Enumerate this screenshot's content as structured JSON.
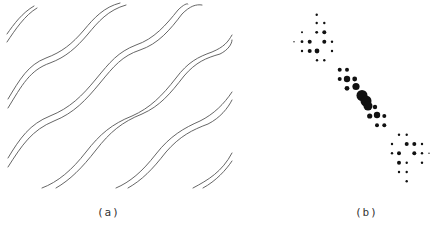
{
  "figure": {
    "panel_a": {
      "caption": "(a)",
      "description": "Pattern of diagonal wavy double lines",
      "stroke_color": "#555555"
    },
    "panel_b": {
      "caption": "(b)",
      "description": "Optical diffraction pattern of dots along a diagonal",
      "dot_color": "#111111",
      "dots": [
        {
          "x": 316.7,
          "y": 14.7,
          "r": 1.2
        },
        {
          "x": 316.7,
          "y": 23.0,
          "r": 1.2
        },
        {
          "x": 324.3,
          "y": 23.0,
          "r": 1.2
        },
        {
          "x": 302.0,
          "y": 32.3,
          "r": 1.0
        },
        {
          "x": 316.7,
          "y": 32.3,
          "r": 1.4
        },
        {
          "x": 324.3,
          "y": 32.3,
          "r": 2.0
        },
        {
          "x": 294.0,
          "y": 41.7,
          "r": 0.7
        },
        {
          "x": 302.0,
          "y": 41.7,
          "r": 1.4
        },
        {
          "x": 309.7,
          "y": 41.7,
          "r": 2.0
        },
        {
          "x": 324.3,
          "y": 41.7,
          "r": 2.0
        },
        {
          "x": 332.0,
          "y": 41.7,
          "r": 1.2
        },
        {
          "x": 302.0,
          "y": 51.0,
          "r": 1.2
        },
        {
          "x": 309.7,
          "y": 51.0,
          "r": 2.0
        },
        {
          "x": 317.0,
          "y": 51.0,
          "r": 2.4
        },
        {
          "x": 332.0,
          "y": 51.0,
          "r": 1.2
        },
        {
          "x": 317.0,
          "y": 60.3,
          "r": 1.2
        },
        {
          "x": 324.3,
          "y": 60.3,
          "r": 1.2
        },
        {
          "x": 339.7,
          "y": 69.7,
          "r": 2.0
        },
        {
          "x": 347.0,
          "y": 69.7,
          "r": 2.0
        },
        {
          "x": 339.7,
          "y": 79.0,
          "r": 2.0
        },
        {
          "x": 347.0,
          "y": 79.0,
          "r": 3.2
        },
        {
          "x": 354.7,
          "y": 79.0,
          "r": 2.4
        },
        {
          "x": 347.0,
          "y": 88.3,
          "r": 2.4
        },
        {
          "x": 356.0,
          "y": 86.5,
          "r": 3.6
        },
        {
          "x": 362.0,
          "y": 95.5,
          "r": 5.5
        },
        {
          "x": 366.0,
          "y": 101.0,
          "r": 5.5
        },
        {
          "x": 368.0,
          "y": 106.0,
          "r": 4.5
        },
        {
          "x": 375.0,
          "y": 107.0,
          "r": 2.2
        },
        {
          "x": 369.7,
          "y": 116.0,
          "r": 2.6
        },
        {
          "x": 377.0,
          "y": 115.0,
          "r": 3.2
        },
        {
          "x": 384.3,
          "y": 116.0,
          "r": 2.0
        },
        {
          "x": 377.0,
          "y": 125.3,
          "r": 2.0
        },
        {
          "x": 384.3,
          "y": 125.3,
          "r": 2.0
        },
        {
          "x": 399.0,
          "y": 134.7,
          "r": 1.2
        },
        {
          "x": 406.7,
          "y": 134.7,
          "r": 1.2
        },
        {
          "x": 392.0,
          "y": 144.0,
          "r": 1.2
        },
        {
          "x": 406.7,
          "y": 144.0,
          "r": 2.0
        },
        {
          "x": 414.3,
          "y": 144.0,
          "r": 2.0
        },
        {
          "x": 422.0,
          "y": 144.0,
          "r": 1.2
        },
        {
          "x": 392.0,
          "y": 153.3,
          "r": 1.2
        },
        {
          "x": 399.0,
          "y": 153.3,
          "r": 2.0
        },
        {
          "x": 414.3,
          "y": 153.3,
          "r": 2.0
        },
        {
          "x": 422.0,
          "y": 153.3,
          "r": 1.2
        },
        {
          "x": 429.0,
          "y": 153.3,
          "r": 0.7
        },
        {
          "x": 399.0,
          "y": 162.7,
          "r": 2.0
        },
        {
          "x": 406.7,
          "y": 162.7,
          "r": 1.2
        },
        {
          "x": 422.0,
          "y": 162.7,
          "r": 1.2
        },
        {
          "x": 399.0,
          "y": 172.0,
          "r": 1.2
        },
        {
          "x": 406.7,
          "y": 172.0,
          "r": 1.2
        },
        {
          "x": 406.7,
          "y": 181.3,
          "r": 1.2
        }
      ]
    }
  }
}
